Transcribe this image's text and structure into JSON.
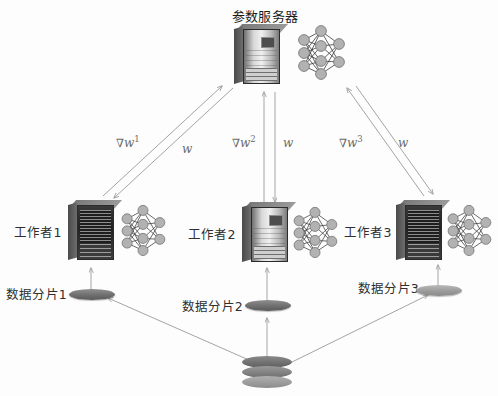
{
  "diagram": {
    "type": "parameter-server-architecture",
    "nodes": {
      "parameter_server": {
        "label": "参数服务器",
        "icon": "server-rack-icon",
        "model_icon": "neural-network-icon"
      },
      "workers": [
        {
          "label": "工作者1",
          "icon": "server-rack-icon",
          "model_icon": "neural-network-icon"
        },
        {
          "label": "工作者2",
          "icon": "server-rack-icon",
          "model_icon": "neural-network-icon"
        },
        {
          "label": "工作者3",
          "icon": "server-rack-icon",
          "model_icon": "neural-network-icon"
        }
      ],
      "shards": [
        {
          "label": "数据分片1",
          "icon": "data-disk-icon"
        },
        {
          "label": "数据分片2",
          "icon": "data-disk-icon"
        },
        {
          "label": "数据分片3",
          "icon": "data-disk-icon"
        }
      ],
      "datastore": {
        "icon": "database-stack-icon"
      }
    },
    "edges": {
      "gradient_1": {
        "nabla": "∇",
        "symbol": "w",
        "superscript": "1"
      },
      "weights_1": {
        "symbol": "w"
      },
      "gradient_2": {
        "nabla": "∇",
        "symbol": "w",
        "superscript": "2"
      },
      "weights_2": {
        "symbol": "w"
      },
      "gradient_3": {
        "nabla": "∇",
        "symbol": "w",
        "superscript": "3"
      },
      "weights_3": {
        "symbol": "w"
      }
    },
    "colors": {
      "line": "#9a9a9a",
      "text": "#2f2f2f",
      "math_text": "#6b6b6b",
      "background": "#fdfdfd"
    }
  }
}
